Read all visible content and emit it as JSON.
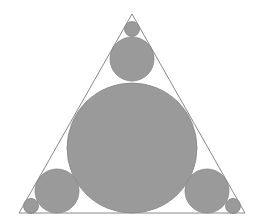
{
  "diagram": {
    "colors": {
      "background": "#ffffff",
      "triangle_stroke": "#8a8a8a",
      "circle_fill": "#9a9a9a",
      "circle_stroke": "#858585"
    },
    "triangle": {
      "points": [
        [
          132,
          14
        ],
        [
          19,
          213
        ],
        [
          245,
          213
        ]
      ]
    },
    "circles": [
      {
        "name": "central-circle",
        "cx": 132,
        "cy": 148,
        "r": 65
      },
      {
        "name": "top-middle-circle",
        "cx": 132,
        "cy": 59,
        "r": 22
      },
      {
        "name": "top-small-circle",
        "cx": 132,
        "cy": 29,
        "r": 7.5
      },
      {
        "name": "bottom-left-medium-circle",
        "cx": 57,
        "cy": 191,
        "r": 22
      },
      {
        "name": "bottom-left-small-circle",
        "cx": 31,
        "cy": 206,
        "r": 7.5
      },
      {
        "name": "bottom-right-medium-circle",
        "cx": 207,
        "cy": 191,
        "r": 22
      },
      {
        "name": "bottom-right-small-circle",
        "cx": 233,
        "cy": 206,
        "r": 7.5
      }
    ]
  }
}
